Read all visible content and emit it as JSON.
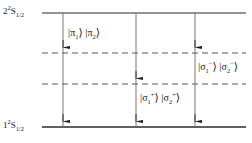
{
  "figure": {
    "type": "energy-level-diagram",
    "background_color": "#ffffff",
    "line_color": "#2b2b2b",
    "dashed_color": "#555566",
    "text_color": "#1a1a1a",
    "width": 252,
    "height": 143
  },
  "levels": [
    {
      "id": "upper",
      "style": "solid",
      "y": 13,
      "x_start": 42,
      "x_end": 246,
      "label": {
        "principal": "2",
        "multiplicity": "2",
        "term": "S",
        "j": "1/2",
        "text": "2 ²S₁⁄₂"
      }
    },
    {
      "id": "dashed-upper",
      "style": "dashed",
      "y": 53,
      "x_start": 42,
      "x_end": 246,
      "label": null
    },
    {
      "id": "dashed-lower",
      "style": "dashed",
      "y": 84,
      "x_start": 42,
      "x_end": 246,
      "label": null
    },
    {
      "id": "lower",
      "style": "solid",
      "y": 127,
      "x_start": 42,
      "x_end": 246,
      "label": {
        "principal": "1",
        "multiplicity": "2",
        "term": "S",
        "j": "1/2",
        "text": "1 ²S₁⁄₂"
      }
    }
  ],
  "transitions": [
    {
      "id": "pi-transition",
      "x": 63,
      "y_top": 13,
      "y_bottom": 127,
      "arrowheads_at": [
        53,
        127
      ],
      "polarization": "pi"
    },
    {
      "id": "sigma-plus-transition",
      "x": 136,
      "y_top": 13,
      "y_bottom": 127,
      "arrowheads_at": [
        84,
        127
      ],
      "polarization": "sigma-plus"
    },
    {
      "id": "sigma-minus-transition",
      "x": 195,
      "y_top": 13,
      "y_bottom": 127,
      "arrowheads_at": [
        53,
        127
      ],
      "polarization": "sigma-minus"
    }
  ],
  "ket_labels": [
    {
      "id": "pi-kets",
      "x": 68,
      "y": 27,
      "text": "|π₁⟩ |π₂⟩",
      "kets": [
        {
          "symbol": "π",
          "sub": "1",
          "sup": ""
        },
        {
          "symbol": "π",
          "sub": "2",
          "sup": ""
        }
      ]
    },
    {
      "id": "sigma-minus-kets",
      "x": 198,
      "y": 61,
      "text": "|σ₁⁻⟩ |σ₂⁻⟩",
      "kets": [
        {
          "symbol": "σ",
          "sub": "1",
          "sup": "−"
        },
        {
          "symbol": "σ",
          "sub": "2",
          "sup": "−"
        }
      ]
    },
    {
      "id": "sigma-plus-kets",
      "x": 140,
      "y": 92,
      "text": "|σ₁⁺⟩ |σ₂⁺⟩",
      "kets": [
        {
          "symbol": "σ",
          "sub": "1",
          "sup": "+"
        },
        {
          "symbol": "σ",
          "sub": "2",
          "sup": "+"
        }
      ]
    }
  ]
}
